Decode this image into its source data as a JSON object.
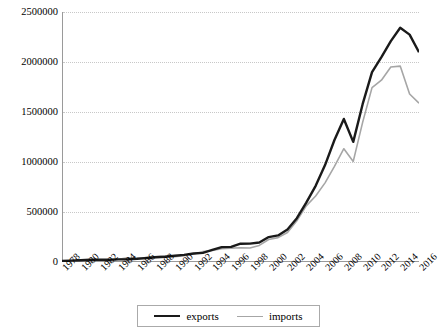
{
  "chart_data": {
    "type": "line",
    "title": "",
    "xlabel": "",
    "ylabel": "",
    "ylim": [
      0,
      2500000
    ],
    "yticks": [
      0,
      500000,
      1000000,
      1500000,
      2000000,
      2500000
    ],
    "ytick_labels": [
      "0",
      "500000",
      "1000000",
      "1500000",
      "2000000",
      "2500000"
    ],
    "grid": true,
    "legend_position": "bottom",
    "x": [
      1978,
      1979,
      1980,
      1981,
      1982,
      1983,
      1984,
      1985,
      1986,
      1987,
      1988,
      1989,
      1990,
      1991,
      1992,
      1993,
      1994,
      1995,
      1996,
      1997,
      1998,
      1999,
      2000,
      2001,
      2002,
      2003,
      2004,
      2005,
      2006,
      2007,
      2008,
      2009,
      2010,
      2011,
      2012,
      2013,
      2014,
      2015,
      2016
    ],
    "xtick_labels": [
      "1978",
      "1980",
      "1982",
      "1984",
      "1986",
      "1988",
      "1990",
      "1992",
      "1994",
      "1996",
      "1998",
      "2000",
      "2002",
      "2004",
      "2006",
      "2008",
      "2010",
      "2012",
      "2014",
      "2016"
    ],
    "series": [
      {
        "name": "exports",
        "color": "#1a1a1a",
        "values": [
          9745,
          13660,
          18120,
          22010,
          22320,
          22230,
          26140,
          27350,
          30940,
          39440,
          47520,
          52540,
          62090,
          71840,
          84940,
          91740,
          121010,
          148780,
          151050,
          182790,
          183710,
          194930,
          249200,
          266100,
          325600,
          438230,
          593260,
          761950,
          968940,
          1220000,
          1430690,
          1201610,
          1577930,
          1898380,
          2048710,
          2209000,
          2342290,
          2273470,
          2097630
        ]
      },
      {
        "name": "imports",
        "color": "#a6a6a6",
        "values": [
          10890,
          15670,
          20020,
          22010,
          19290,
          21390,
          27410,
          42250,
          42900,
          43220,
          55270,
          59140,
          53350,
          63790,
          80590,
          103960,
          115610,
          132080,
          138830,
          142370,
          140170,
          165700,
          225090,
          243550,
          295200,
          412760,
          561230,
          659950,
          791460,
          956120,
          1132570,
          1005920,
          1396000,
          1743480,
          1818400,
          1949890,
          1959240,
          1679560,
          1587930
        ]
      }
    ]
  },
  "legend": {
    "items": [
      {
        "label": "exports"
      },
      {
        "label": "imports"
      }
    ]
  }
}
